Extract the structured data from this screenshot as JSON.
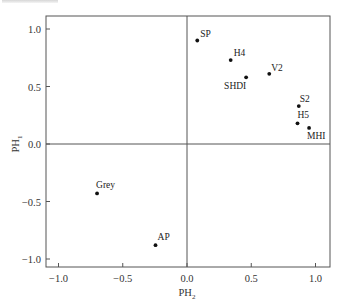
{
  "chart_data": {
    "type": "scatter",
    "title": "",
    "xlabel": "PH2",
    "ylabel": "PH1",
    "xlabel_main": "PH",
    "xlabel_sub": "2",
    "ylabel_main": "PH",
    "ylabel_sub": "1",
    "xlim": [
      -1.1,
      1.12
    ],
    "ylim": [
      -1.1,
      1.12
    ],
    "xticks": [
      -1.0,
      -0.5,
      0.0,
      0.5,
      1.0
    ],
    "xtick_labels": [
      "−1.0",
      "−0.5",
      "0.0",
      "0.5",
      "1.0"
    ],
    "yticks": [
      1.0,
      0.5,
      0.0,
      -0.5,
      -1.0
    ],
    "ytick_labels": [
      "1.0",
      "0.5",
      "0.0",
      "−0.5",
      "−1.0"
    ],
    "grid": false,
    "reference_lines": {
      "x": 0.0,
      "y": 0.0
    },
    "legend": null,
    "points": [
      {
        "label": "SP",
        "x": 0.08,
        "y": 0.9,
        "label_dx": 3,
        "label_dy": -4
      },
      {
        "label": "H4",
        "x": 0.34,
        "y": 0.73,
        "label_dx": 3,
        "label_dy": -4
      },
      {
        "label": "SHDI",
        "x": 0.46,
        "y": 0.58,
        "label_dx": -22,
        "label_dy": 12
      },
      {
        "label": "V2",
        "x": 0.64,
        "y": 0.61,
        "label_dx": 2,
        "label_dy": -3
      },
      {
        "label": "S2",
        "x": 0.87,
        "y": 0.33,
        "label_dx": 1,
        "label_dy": -4
      },
      {
        "label": "H5",
        "x": 0.86,
        "y": 0.18,
        "label_dx": 0,
        "label_dy": -5
      },
      {
        "label": "MHI",
        "x": 0.95,
        "y": 0.14,
        "label_dx": -2,
        "label_dy": 11
      },
      {
        "label": "Grey",
        "x": -0.7,
        "y": -0.43,
        "label_dx": -1,
        "label_dy": -5
      },
      {
        "label": "AP",
        "x": -0.245,
        "y": -0.88,
        "label_dx": 2,
        "label_dy": -5
      }
    ]
  },
  "layout": {
    "frame": {
      "left": 46,
      "top": 16,
      "right": 330,
      "bottom": 267
    },
    "origin_px": {
      "x": 187,
      "y": 144
    },
    "px_per_unit": {
      "x": 128.5,
      "y": 115
    }
  },
  "colors": {
    "axis": "#555555",
    "point": "#111111",
    "text": "#333333"
  }
}
